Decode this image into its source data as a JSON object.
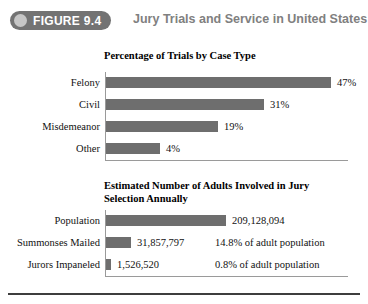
{
  "header": {
    "badge_label": "FIGURE 9.4",
    "badge_icon": "circle-icon",
    "title": "Jury Trials and Service in United States",
    "badge_bg": "#737373",
    "title_color": "#808080"
  },
  "chart_data": [
    {
      "type": "bar",
      "title": "Percentage of Trials by Case Type",
      "xlabel": "",
      "ylabel": "",
      "orientation": "horizontal",
      "grid": false,
      "legend": "none",
      "bar_color": "#6e6e6e",
      "categories": [
        "Felony",
        "Civil",
        "Misdemeanor",
        "Other"
      ],
      "values": [
        47,
        31,
        19,
        4
      ],
      "value_labels": [
        "47%",
        "31%",
        "19%",
        "4%"
      ],
      "bar_pixel_widths": [
        225,
        158,
        112,
        54
      ]
    },
    {
      "type": "bar",
      "title": "Estimated Number of Adults Involved in Jury Selection Annually",
      "title_line1": "Estimated Number of Adults Involved in Jury",
      "title_line2": "Selection Annually",
      "xlabel": "",
      "ylabel": "",
      "orientation": "horizontal",
      "grid": false,
      "legend": "none",
      "bar_color": "#6e6e6e",
      "categories": [
        "Population",
        "Summonses Mailed",
        "Jurors Impaneled"
      ],
      "values": [
        209128094,
        31857797,
        1526520
      ],
      "value_labels": [
        "209,128,094",
        "31,857,797",
        "1,526,520"
      ],
      "annotations": [
        "",
        "14.8% of adult population",
        "0.8% of adult population"
      ],
      "bar_pixel_widths": [
        120,
        25,
        5
      ]
    }
  ]
}
